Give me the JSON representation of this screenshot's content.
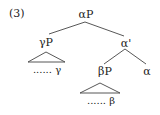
{
  "example_number": "(3)",
  "tree": {
    "root": {
      "label": "αP"
    },
    "left": {
      "label": "γP",
      "terminal": "...... γ"
    },
    "right": {
      "label": "α'",
      "left": {
        "label": "βP",
        "terminal": "...... β"
      },
      "right": {
        "label": "α"
      }
    }
  },
  "colors": {
    "line": "#444444",
    "text": "#222222"
  }
}
